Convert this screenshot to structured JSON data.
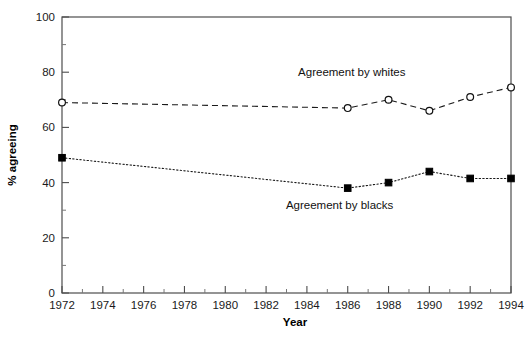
{
  "chart_data": {
    "type": "line",
    "title": "",
    "xlabel": "Year",
    "ylabel": "% agreeing",
    "xlim": [
      1972,
      1994
    ],
    "ylim": [
      0,
      100
    ],
    "grid": false,
    "legend_position": "inline-annotation",
    "x_ticks": [
      1972,
      1974,
      1976,
      1978,
      1980,
      1982,
      1984,
      1986,
      1988,
      1990,
      1992,
      1994
    ],
    "x_tick_labels": [
      "1972",
      "1974",
      "1976",
      "1978",
      "1980",
      "1982",
      "1984",
      "1986",
      "1988",
      "1990",
      "1992",
      "1994"
    ],
    "y_ticks": [
      0,
      20,
      40,
      60,
      80,
      100
    ],
    "y_tick_labels": [
      "0",
      "20",
      "40",
      "60",
      "80",
      "100"
    ],
    "y_minor_ticks": [
      10,
      30,
      50,
      70,
      90
    ],
    "series": [
      {
        "name": "Agreement by whites",
        "marker": "open-circle",
        "linestyle": "dashed",
        "color": "#111111",
        "x": [
          1972,
          1986,
          1988,
          1990,
          1992,
          1994
        ],
        "values": [
          69,
          67,
          70,
          66,
          71,
          74.5
        ]
      },
      {
        "name": "Agreement by blacks",
        "marker": "filled-square",
        "linestyle": "dotted",
        "color": "#000000",
        "x": [
          1972,
          1986,
          1988,
          1990,
          1992,
          1994
        ],
        "values": [
          49,
          38,
          40,
          44,
          41.5,
          41.5
        ]
      }
    ],
    "annotations": [
      {
        "text": "Agreement by whites",
        "x": 1986.2,
        "y": 78.5,
        "anchor": "middle"
      },
      {
        "text": "Agreement by blacks",
        "x": 1985.6,
        "y": 30.5,
        "anchor": "middle"
      }
    ]
  }
}
